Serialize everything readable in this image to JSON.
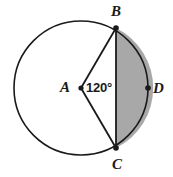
{
  "figure": {
    "kind": "circle-central-angle-diagram",
    "background_color": "#ffffff",
    "stroke_color": "#1a1a1a",
    "shaded_fill_color": "#a8a8a8",
    "shaded_region_description": "circular segment bounded by chord BC and arc B-D-C"
  },
  "circle": {
    "center_label": "A",
    "center_x": 81,
    "center_y": 88,
    "radius": 67
  },
  "points": [
    {
      "label": "A",
      "role": "center",
      "x": 81,
      "y": 88
    },
    {
      "label": "B",
      "role": "on-circle",
      "x": 116,
      "y": 28
    },
    {
      "label": "C",
      "role": "on-circle",
      "x": 116,
      "y": 148
    },
    {
      "label": "D",
      "role": "on-circle",
      "x": 148,
      "y": 88
    }
  ],
  "segments": [
    {
      "name": "radius-AB",
      "from": "A",
      "to": "B"
    },
    {
      "name": "radius-AC",
      "from": "A",
      "to": "C"
    },
    {
      "name": "chord-BC",
      "from": "B",
      "to": "C"
    }
  ],
  "angle": {
    "vertex": "A",
    "from_ray": "AB",
    "to_ray": "AC",
    "measure_text": "120°",
    "measure_value": 120,
    "units": "degrees"
  },
  "labels": {
    "A": "A",
    "B": "B",
    "C": "C",
    "D": "D",
    "angle": "120°"
  }
}
